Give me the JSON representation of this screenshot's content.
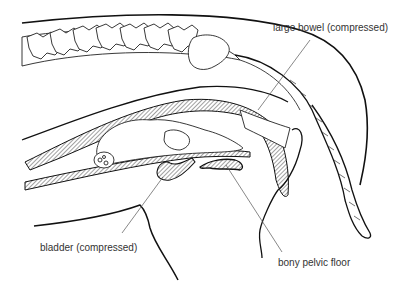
{
  "diagram": {
    "labels": [
      {
        "id": "large-bowel",
        "text": "large bowel (compressed)",
        "x": 273,
        "y": 23
      },
      {
        "id": "bladder",
        "text": "bladder (compressed)",
        "x": 40,
        "y": 243
      },
      {
        "id": "pelvic-floor",
        "text": "bony pelvic floor",
        "x": 278,
        "y": 258
      }
    ],
    "colors": {
      "line": "#111111",
      "label": "#333333",
      "leader": "#555555",
      "hatch": "#444444",
      "background": "#ffffff"
    }
  }
}
